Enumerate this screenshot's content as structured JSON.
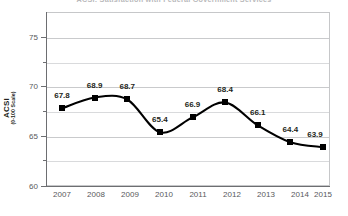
{
  "chart_data": {
    "type": "line",
    "title": "ACSI: Satisfaction with Federal Government Services",
    "xlabel": "",
    "ylabel": "ACSI",
    "ylabel_sub": "(0-100 Scale)",
    "categories": [
      "2007",
      "2008",
      "2009",
      "2010",
      "2011",
      "2012",
      "2013",
      "2014",
      "2015"
    ],
    "values": [
      67.8,
      68.9,
      68.7,
      65.4,
      66.9,
      68.4,
      66.1,
      64.4,
      63.9
    ],
    "point_labels": [
      "67.8",
      "68.9",
      "68.7",
      "65.4",
      "66.9",
      "68.4",
      "66.1",
      "64.4",
      "63.9"
    ],
    "ylim": [
      60,
      77.5
    ],
    "y_ticks_major": [
      60,
      65,
      70,
      75
    ],
    "y_tick_labels_major": [
      "60",
      "65",
      "70",
      "75"
    ],
    "y_ticks_minor": [
      62.5,
      67.5,
      72.5
    ],
    "grid": true,
    "legend": "none",
    "series_color": "#000000",
    "marker": "square",
    "line_smoothing": "spline"
  },
  "style": {
    "plot_background": "#ffffff",
    "grid_color": "#c9cacc",
    "axis_color": "#6d6e71",
    "text_color": "#231f20",
    "title_color": "#b9b9bb"
  }
}
